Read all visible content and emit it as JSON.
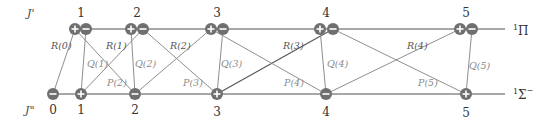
{
  "axis_labels": {
    "upper": "J'",
    "lower": "J\""
  },
  "states": {
    "upper": "Π",
    "upper_sup": "1",
    "lower": "Σ",
    "lower_sup": "1",
    "lower_suffix": "−"
  },
  "upper_levels": [
    {
      "j": "1",
      "x_plus": 75,
      "x_minus": 86
    },
    {
      "j": "2",
      "x_plus": 131,
      "x_minus": 143
    },
    {
      "j": "3",
      "x_plus": 211,
      "x_minus": 223
    },
    {
      "j": "4",
      "x_plus": 320,
      "x_minus": 333
    },
    {
      "j": "5",
      "x_plus": 460,
      "x_minus": 472
    }
  ],
  "lower_levels": [
    {
      "j": "0",
      "x": 53,
      "parity": "−"
    },
    {
      "j": "1",
      "x": 81,
      "parity": "+"
    },
    {
      "j": "2",
      "x": 135,
      "parity": "−"
    },
    {
      "j": "3",
      "x": 217,
      "parity": "+"
    },
    {
      "j": "4",
      "x": 326,
      "parity": "−"
    },
    {
      "j": "5",
      "x": 466,
      "parity": "+"
    }
  ],
  "transitions": {
    "R": [
      "R(0)",
      "R(1)",
      "R(2)",
      "R(3)",
      "R(4)"
    ],
    "Q": [
      "Q(1)",
      "Q(2)",
      "Q(3)",
      "Q(4)",
      "Q(5)"
    ],
    "P": [
      "P(2)",
      "P(3)",
      "P(4)",
      "P(5)"
    ]
  }
}
